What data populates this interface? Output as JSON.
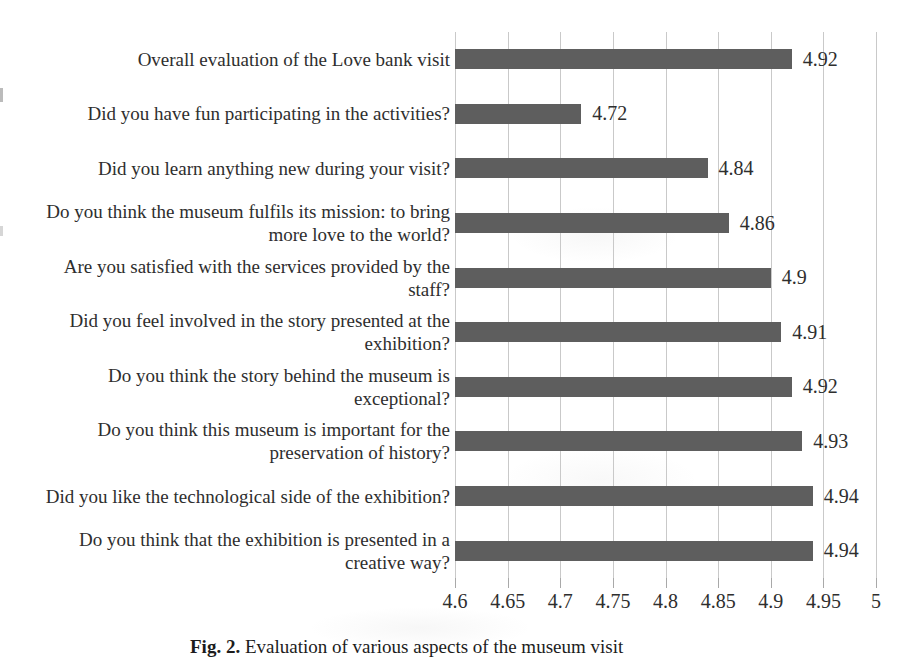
{
  "figure": {
    "caption_prefix": "Fig. 2.",
    "caption_text": " Evaluation of various aspects of the museum visit"
  },
  "chart_data": {
    "type": "bar",
    "orientation": "horizontal",
    "title": "",
    "xlabel": "",
    "ylabel": "",
    "categories": [
      "Overall evaluation of the Love bank visit",
      "Did you have fun participating in the activities?",
      "Did you learn anything new during your visit?",
      "Do you think the museum fulfils its mission: to bring more love to the world?",
      "Are you satisfied with the services provided by the staff?",
      "Did you feel involved in the story presented at the exhibition?",
      "Do you think the story behind the museum is exceptional?",
      "Do you think this museum is important for the preservation of history?",
      "Did you like the technological side of the exhibition?",
      "Do you think that the exhibition is presented in a creative way?"
    ],
    "values": [
      4.92,
      4.72,
      4.84,
      4.86,
      4.9,
      4.91,
      4.92,
      4.93,
      4.94,
      4.94
    ],
    "value_labels": [
      "4.92",
      "4.72",
      "4.84",
      "4.86",
      "4.9",
      "4.91",
      "4.92",
      "4.93",
      "4.94",
      "4.94"
    ],
    "xlim": [
      4.6,
      5.0
    ],
    "x_ticks": [
      "4.6",
      "4.65",
      "4.7",
      "4.75",
      "4.8",
      "4.85",
      "4.9",
      "4.95",
      "5"
    ],
    "grid": true,
    "legend": false,
    "bar_color": "#5e5e5e",
    "gridline_color": "#c9c9c9",
    "tick_color": "#a9a9a9",
    "text_color": "#2e2e2e"
  }
}
